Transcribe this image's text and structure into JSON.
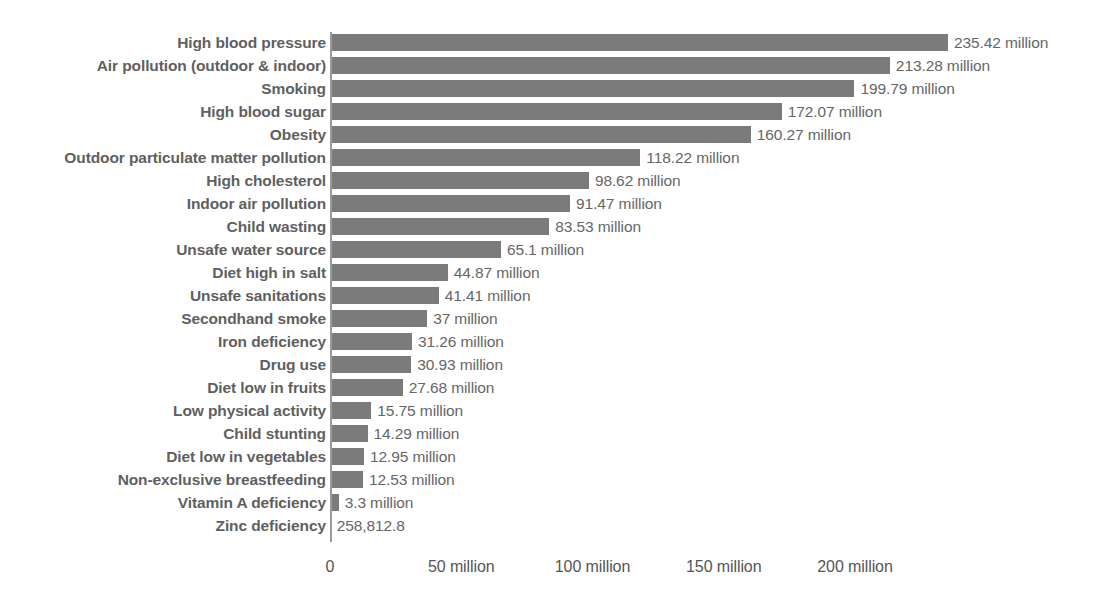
{
  "chart_data": {
    "type": "bar",
    "orientation": "horizontal",
    "title": "",
    "subtitle": "",
    "xlabel": "",
    "ylabel": "",
    "grid": false,
    "legend": null,
    "xlim": [
      0,
      235.42
    ],
    "axis_ticks": [
      {
        "value": 0,
        "label": "0"
      },
      {
        "value": 50,
        "label": "50 million"
      },
      {
        "value": 100,
        "label": "100 million"
      },
      {
        "value": 150,
        "label": "150 million"
      },
      {
        "value": 200,
        "label": "200 million"
      }
    ],
    "unit": "million",
    "categories": [
      "High blood pressure",
      "Air pollution (outdoor & indoor)",
      "Smoking",
      "High blood sugar",
      "Obesity",
      "Outdoor particulate matter pollution",
      "High cholesterol",
      "Indoor air pollution",
      "Child wasting",
      "Unsafe water source",
      "Diet high in salt",
      "Unsafe sanitations",
      "Secondhand smoke",
      "Iron deficiency",
      "Drug use",
      "Diet low in fruits",
      "Low physical activity",
      "Child stunting",
      "Diet low in vegetables",
      "Non-exclusive breastfeeding",
      "Vitamin A deficiency",
      "Zinc deficiency"
    ],
    "values": [
      235.42,
      213.28,
      199.79,
      172.07,
      160.27,
      118.22,
      98.62,
      91.47,
      83.53,
      65.1,
      44.87,
      41.41,
      37,
      31.26,
      30.93,
      27.68,
      15.75,
      14.29,
      12.95,
      12.53,
      3.3,
      0.2588128
    ],
    "value_labels": [
      "235.42 million",
      "213.28 million",
      "199.79 million",
      "172.07 million",
      "160.27 million",
      "118.22 million",
      "98.62 million",
      "91.47 million",
      "83.53 million",
      "65.1 million",
      "44.87 million",
      "41.41 million",
      "37 million",
      "31.26 million",
      "30.93 million",
      "27.68 million",
      "15.75 million",
      "14.29 million",
      "12.95 million",
      "12.53 million",
      "3.3 million",
      "258,812.8"
    ],
    "colors": {
      "bar": "#7b7b7b",
      "category_label": "#5f5f5f",
      "value_label": "#666666",
      "axis": "#9a9a9a",
      "background": "#ffffff"
    }
  }
}
